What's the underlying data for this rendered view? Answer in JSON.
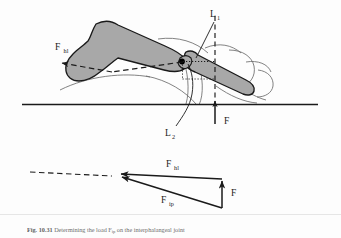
{
  "figure": {
    "number": "Fig. 10.31",
    "caption_text": "Determining the load F",
    "caption_sub1": "ip",
    "caption_text2": " on the interphalangeal joint",
    "caption_full": "Fig. 10.31 Determining the load Fip on the interphalangeal joint"
  },
  "labels": {
    "force_hl": {
      "symbol": "F",
      "subscript": "hl"
    },
    "force_ground": {
      "symbol": "F",
      "subscript": ""
    },
    "force_ip": {
      "symbol": "F",
      "subscript": "ip"
    },
    "lever_arm_1": {
      "symbol": "L",
      "subscript": "1"
    },
    "lever_arm_2": {
      "symbol": "L",
      "subscript": "2"
    },
    "vector_hl": {
      "symbol": "F",
      "subscript": "hl"
    },
    "vector_f": {
      "symbol": "F",
      "subscript": ""
    },
    "vector_ip": {
      "symbol": "F",
      "subscript": "ip"
    }
  },
  "colors": {
    "background": "#fdfdfd",
    "bone_fill": "#a8a8a8",
    "bone_stroke": "#1a1a1a",
    "soft_tissue_stroke": "#5a5a5a",
    "ground_line": "#1a1a1a",
    "label_text": "#1a1a1a",
    "caption_text": "#6e6e6e",
    "joint_dot": "#000000"
  },
  "elements": {
    "ground_line_name": "ground-reference-line",
    "joint_center_name": "joint-center-dot",
    "proximal_phalanx": "proximal-phalanx-bone",
    "distal_phalanx": "distal-phalanx-bone",
    "soft_tissue": "soft-tissue-outline"
  }
}
